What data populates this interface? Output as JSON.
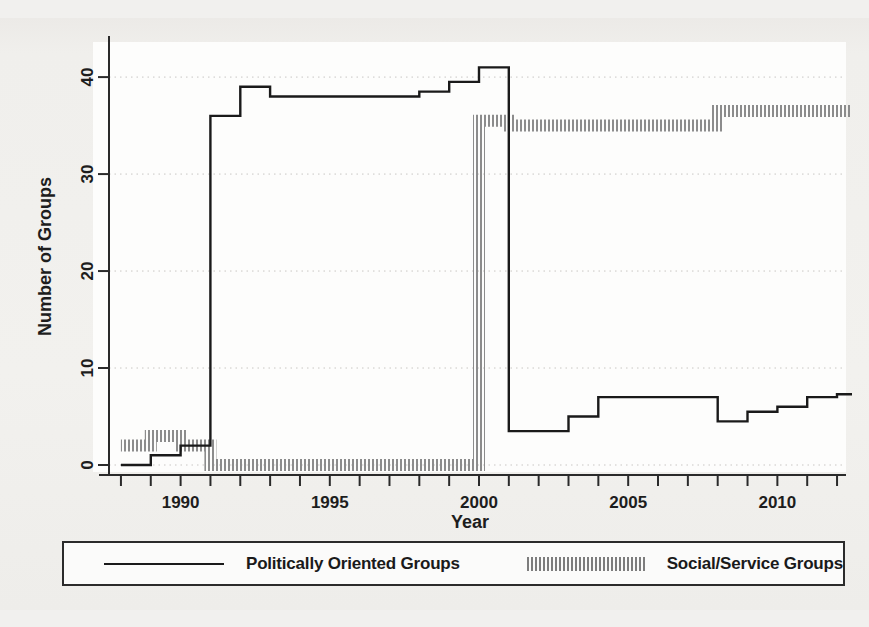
{
  "chart_data": {
    "type": "line",
    "title": "",
    "xlabel": "Year",
    "ylabel": "Number of Groups",
    "xlim": [
      1987.6,
      2012.3
    ],
    "ylim": [
      0,
      43
    ],
    "yticks": [
      0,
      10,
      20,
      30,
      40
    ],
    "ytick_labels": [
      "0",
      "10",
      "20",
      "30",
      "40"
    ],
    "xticks": [
      1990,
      1995,
      2000,
      2005,
      2010
    ],
    "xtick_labels": [
      "1990",
      "1995",
      "2000",
      "2005",
      "2010"
    ],
    "xminor_step": 1,
    "grid": "horizontal-dotted",
    "legend_position": "below-plot",
    "series": [
      {
        "name": "Politically Oriented Groups",
        "style": "solid-step",
        "color": "#1a1a1a",
        "x": [
          1988,
          1989,
          1990,
          1991,
          1992,
          1993,
          1994,
          1995,
          1996,
          1997,
          1998,
          1999,
          2000,
          2001,
          2002,
          2003,
          2004,
          2005,
          2006,
          2007,
          2008,
          2009,
          2010,
          2011,
          2012
        ],
        "values": [
          0,
          1,
          2,
          36,
          39,
          38,
          38,
          38,
          38,
          38,
          38.5,
          39.5,
          41,
          3.5,
          3.5,
          5,
          7,
          7,
          7,
          7,
          4.5,
          5.5,
          6,
          7,
          7.3
        ]
      },
      {
        "name": "Social/Service Groups",
        "style": "hatched-step",
        "color": "#8a8a8a",
        "x": [
          1988,
          1989,
          1990,
          1991,
          1992,
          1993,
          1994,
          1995,
          1996,
          1997,
          1998,
          1999,
          2000,
          2001,
          2002,
          2003,
          2004,
          2005,
          2006,
          2007,
          2008,
          2009,
          2010,
          2011,
          2012
        ],
        "values": [
          2,
          3,
          2,
          0,
          0,
          0,
          0,
          0,
          0,
          0,
          0,
          0,
          35.5,
          35,
          35,
          35,
          35,
          35,
          35,
          35,
          36.5,
          36.5,
          36.5,
          36.5,
          36.5
        ]
      }
    ]
  },
  "legend": {
    "entries": [
      {
        "label": "Politically Oriented Groups",
        "marker": "solid-line"
      },
      {
        "label": "Social/Service Groups",
        "marker": "hatched-band"
      }
    ]
  }
}
